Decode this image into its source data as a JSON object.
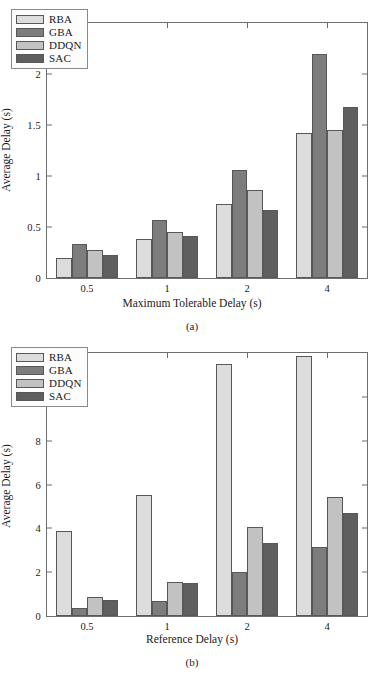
{
  "chart_data": [
    {
      "type": "bar",
      "panel": "(a)",
      "title": "",
      "xlabel": "Maximum Tolerable Delay (s)",
      "ylabel": "Average Delay (s)",
      "categories": [
        "0.5",
        "1",
        "2",
        "4"
      ],
      "ylim": [
        0,
        2.5
      ],
      "yticks": [
        "0",
        "0.5",
        "1",
        "1.5",
        "2",
        "2.5"
      ],
      "ytick_values": [
        0,
        0.5,
        1,
        1.5,
        2,
        2.5
      ],
      "grid": false,
      "legend_position": "top-left",
      "series": [
        {
          "name": "RBA",
          "color": "#dcdcdc",
          "values": [
            0.2,
            0.38,
            0.73,
            1.42
          ]
        },
        {
          "name": "GBA",
          "color": "#7d7d7d",
          "values": [
            0.33,
            0.57,
            1.06,
            2.2
          ]
        },
        {
          "name": "DDQN",
          "color": "#c2c2c2",
          "values": [
            0.27,
            0.45,
            0.86,
            1.45
          ]
        },
        {
          "name": "SAC",
          "color": "#5f5f5f",
          "values": [
            0.23,
            0.41,
            0.67,
            1.68
          ]
        }
      ]
    },
    {
      "type": "bar",
      "panel": "(b)",
      "title": "",
      "xlabel": "Reference Delay (s)",
      "ylabel": "Average Delay (s)",
      "categories": [
        "0.5",
        "1",
        "2",
        "4"
      ],
      "ylim": [
        0,
        12
      ],
      "yticks": [
        "0",
        "2",
        "4",
        "6",
        "8",
        "10",
        "12"
      ],
      "ytick_values": [
        0,
        2,
        4,
        6,
        8,
        10,
        12
      ],
      "grid": false,
      "legend_position": "top-left",
      "series": [
        {
          "name": "RBA",
          "color": "#dcdcdc",
          "values": [
            3.9,
            5.52,
            11.5,
            11.85
          ]
        },
        {
          "name": "GBA",
          "color": "#7d7d7d",
          "values": [
            0.37,
            0.7,
            2.02,
            3.17
          ]
        },
        {
          "name": "DDQN",
          "color": "#c2c2c2",
          "values": [
            0.88,
            1.56,
            4.05,
            5.42
          ]
        },
        {
          "name": "SAC",
          "color": "#5f5f5f",
          "values": [
            0.72,
            1.52,
            3.35,
            4.72
          ]
        }
      ]
    }
  ]
}
